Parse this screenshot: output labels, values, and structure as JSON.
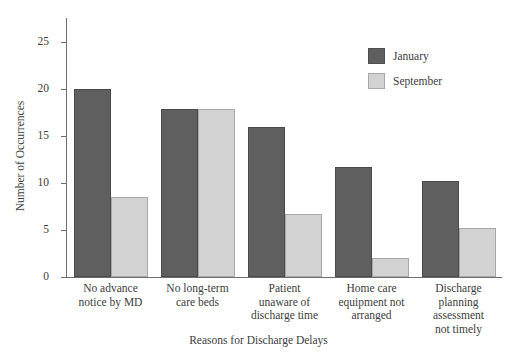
{
  "chart_data": {
    "type": "bar",
    "title": "",
    "xlabel": "Reasons for Discharge Delays",
    "ylabel": "Number of Occurrences",
    "ylim": [
      0,
      27.5
    ],
    "yticks": [
      0,
      5,
      10,
      15,
      20,
      25
    ],
    "ytick_labels": [
      "0",
      "5",
      "10",
      "15",
      "20",
      "25"
    ],
    "grid": false,
    "legend_position": "upper right",
    "categories": [
      "No advance notice by MD",
      "No long-term care beds",
      "Patient unaware of discharge time",
      "Home care equipment not arranged",
      "Discharge planning assessment not timely"
    ],
    "category_lines": [
      [
        "No advance",
        "notice by MD"
      ],
      [
        "No long-term",
        "care beds"
      ],
      [
        "Patient",
        "unaware of",
        "discharge time"
      ],
      [
        "Home care",
        "equipment not",
        "arranged"
      ],
      [
        "Discharge",
        "planning",
        "assessment",
        "not timely"
      ]
    ],
    "series": [
      {
        "name": "January",
        "color": "#5f5f5f",
        "values": [
          20,
          17.8,
          15.9,
          11.7,
          10.2
        ]
      },
      {
        "name": "September",
        "color": "#d2d2d2",
        "values": [
          8.5,
          17.8,
          6.7,
          2.0,
          5.2
        ]
      }
    ]
  },
  "legend": {
    "items": [
      {
        "label": "January"
      },
      {
        "label": "September"
      }
    ]
  },
  "colors": {
    "january": "#5f5f5f",
    "september": "#d2d2d2",
    "axis": "#6e6e6e",
    "text": "#3d3d3d",
    "background": "#ffffff"
  }
}
